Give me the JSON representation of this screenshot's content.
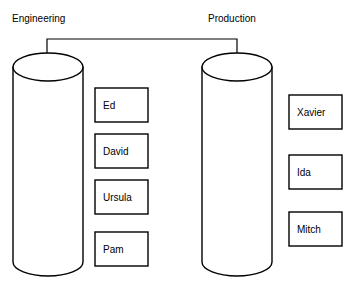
{
  "diagram": {
    "type": "entity-assignment-diagram",
    "background_color": "#ffffff",
    "stroke_color": "#000000",
    "groups": [
      {
        "id": "engineering",
        "label": "Engineering",
        "label_x": 12,
        "label_y": 22,
        "cylinder": {
          "x": 13,
          "y": 53,
          "width": 70,
          "height": 223,
          "ellipse_ry": 14
        },
        "arrow": {
          "stem_x": 47,
          "tip_y": 73
        },
        "members": [
          {
            "label": "Ed",
            "x": 95,
            "y": 88,
            "width": 53,
            "height": 34
          },
          {
            "label": "David",
            "x": 95,
            "y": 134,
            "width": 53,
            "height": 34
          },
          {
            "label": "Ursula",
            "x": 95,
            "y": 180,
            "width": 53,
            "height": 34
          },
          {
            "label": "Pam",
            "x": 95,
            "y": 232,
            "width": 53,
            "height": 34
          }
        ]
      },
      {
        "id": "production",
        "label": "Production",
        "label_x": 208,
        "label_y": 22,
        "cylinder": {
          "x": 202,
          "y": 53,
          "width": 70,
          "height": 223,
          "ellipse_ry": 14
        },
        "arrow": {
          "stem_x": 237,
          "tip_y": 73
        },
        "members": [
          {
            "label": "Xavier",
            "x": 289,
            "y": 95,
            "width": 53,
            "height": 34
          },
          {
            "label": "Ida",
            "x": 289,
            "y": 155,
            "width": 53,
            "height": 34
          },
          {
            "label": "Mitch",
            "x": 289,
            "y": 212,
            "width": 53,
            "height": 34
          }
        ]
      }
    ],
    "connector": {
      "label": "",
      "y": 39,
      "from_x": 47,
      "to_x": 237
    }
  }
}
